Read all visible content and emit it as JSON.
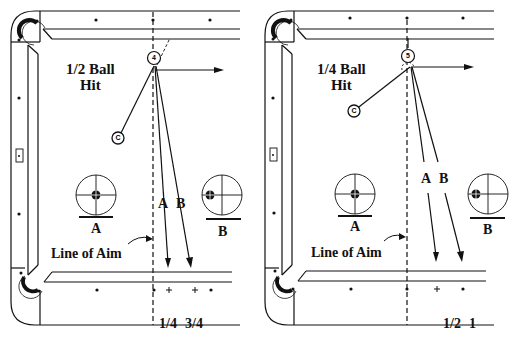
{
  "panels": [
    {
      "title_line1": "1/2 Ball",
      "title_line2": "Hit",
      "object_ball": "4",
      "cue_ball": "C",
      "path_a_label": "A",
      "path_b_label": "B",
      "tip_a_label": "A",
      "tip_b_label": "B",
      "line_of_aim": "Line of Aim",
      "bottom_labels": [
        "1/4",
        "3/4"
      ]
    },
    {
      "title_line1": "1/4 Ball",
      "title_line2": "Hit",
      "object_ball": "5",
      "cue_ball": "C",
      "path_a_label": "A",
      "path_b_label": "B",
      "tip_a_label": "A",
      "tip_b_label": "B",
      "line_of_aim": "Line of Aim",
      "bottom_labels": [
        "1/2",
        "1"
      ]
    }
  ],
  "colors": {
    "line": "#111111",
    "background": "#ffffff"
  }
}
